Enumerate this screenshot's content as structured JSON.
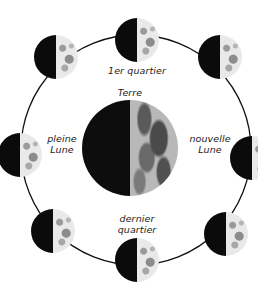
{
  "diagram": {
    "center_label": "Terre",
    "labels": {
      "top": "1er quartier",
      "left_line1": "pleine",
      "left_line2": "Lune",
      "right_line1": "nouvelle",
      "right_line2": "Lune",
      "bottom_line1": "dernier",
      "bottom_line2": "quartier"
    },
    "orbit": {
      "cx": 136,
      "cy": 150,
      "r": 115,
      "stroke": "#111111"
    },
    "colors": {
      "dark_side": "#0b0b0b",
      "lit_side": "#e9e9e9",
      "background": "#ffffff"
    },
    "moons": [
      {
        "id": "top",
        "cx": 137,
        "cy": 40
      },
      {
        "id": "top-right",
        "cx": 220,
        "cy": 57
      },
      {
        "id": "right",
        "cx": 252,
        "cy": 158
      },
      {
        "id": "bottom-right",
        "cx": 226,
        "cy": 234
      },
      {
        "id": "bottom",
        "cx": 137,
        "cy": 260
      },
      {
        "id": "bottom-left",
        "cx": 53,
        "cy": 231
      },
      {
        "id": "left",
        "cx": 20,
        "cy": 155
      },
      {
        "id": "top-left",
        "cx": 56,
        "cy": 57
      }
    ],
    "earth": {
      "cx": 130,
      "cy": 148,
      "r": 48
    }
  }
}
